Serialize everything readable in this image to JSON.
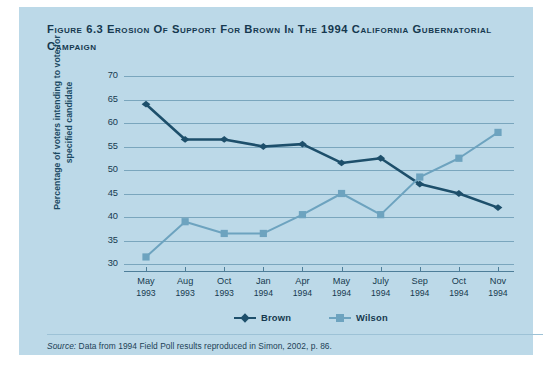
{
  "figure": {
    "number_label": "Figure 6.3",
    "title": "Erosion of Support for Brown in the 1994 California Gubernatorial Campaign",
    "source_prefix": "Source:",
    "source_text": " Data from 1994 Field Poll results reproduced in Simon, 2002, p. 86."
  },
  "colors": {
    "panel_bg": "#bcd9e8",
    "page_bg": "#ffffff",
    "brown_series": "#1d4f6b",
    "wilson_series": "#6da3bf",
    "gridline": "#6f9cb5",
    "text": "#16394f",
    "axis_title": "#1b4a63"
  },
  "chart_data": {
    "type": "line",
    "title": "Erosion of Support for Brown in the 1994 California Gubernatorial Campaign",
    "xlabel": "",
    "ylabel": "Percentage of voters intending to vote for specified candidate",
    "ylim": [
      30,
      70
    ],
    "yticks": [
      30,
      35,
      40,
      45,
      50,
      55,
      60,
      65,
      70
    ],
    "grid": true,
    "legend_position": "bottom-center",
    "categories": [
      "May 1993",
      "Aug 1993",
      "Oct 1993",
      "Jan 1994",
      "Apr 1994",
      "May 1994",
      "July 1994",
      "Sep 1994",
      "Oct 1994",
      "Nov 1994"
    ],
    "category_months": [
      "May",
      "Aug",
      "Oct",
      "Jan",
      "Apr",
      "May",
      "July",
      "Sep",
      "Oct",
      "Nov"
    ],
    "category_years": [
      "1993",
      "1993",
      "1993",
      "1994",
      "1994",
      "1994",
      "1994",
      "1994",
      "1994",
      "1994"
    ],
    "series": [
      {
        "name": "Brown",
        "color": "#1d4f6b",
        "marker": "diamond",
        "values": [
          64,
          56.5,
          56.5,
          55,
          55.5,
          51.5,
          52.5,
          47,
          45,
          42
        ]
      },
      {
        "name": "Wilson",
        "color": "#6da3bf",
        "marker": "square",
        "values": [
          31.5,
          39,
          36.5,
          36.5,
          40.5,
          45,
          40.5,
          48.5,
          52.5,
          58
        ]
      }
    ]
  }
}
